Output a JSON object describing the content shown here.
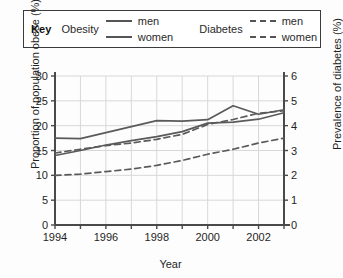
{
  "legend": {
    "title": "Key",
    "groups": [
      {
        "name": "Obesity",
        "entries": [
          {
            "label": "men",
            "style": "solid"
          },
          {
            "label": "women",
            "style": "solid"
          }
        ]
      },
      {
        "name": "Diabetes",
        "entries": [
          {
            "label": "men",
            "style": "dashed"
          },
          {
            "label": "women",
            "style": "dashed"
          }
        ]
      }
    ]
  },
  "axes": {
    "x_title": "Year",
    "y_left_title": "Proportion of population obese (%)",
    "y_right_title": "Prevalence of diabetes (%)",
    "x_ticks": [
      "1994",
      "1996",
      "1998",
      "2000",
      "2002"
    ],
    "y_left_ticks": [
      "0",
      "5",
      "10",
      "15",
      "20",
      "25",
      "30"
    ],
    "y_right_ticks": [
      "0",
      "1",
      "2",
      "3",
      "4",
      "5",
      "6"
    ]
  },
  "colors": {
    "line": "#5a5a5a",
    "axis": "#4a4a4a",
    "grid": "#d8d8d8",
    "background": "#fdfdfd"
  },
  "chart_data": {
    "type": "line",
    "title": "",
    "xlabel": "Year",
    "ylabel": "Proportion of population obese (%)",
    "y2label": "Prevalence of diabetes (%)",
    "xlim": [
      1994,
      2003
    ],
    "ylim": [
      0,
      30
    ],
    "y2lim": [
      0,
      6
    ],
    "grid": true,
    "legend_position": "top",
    "x": [
      1994,
      1995,
      1996,
      1997,
      1998,
      1999,
      2000,
      2001,
      2002,
      2003
    ],
    "series": [
      {
        "name": "Obesity men",
        "axis": "left",
        "style": "solid",
        "units": "%",
        "values": [
          17.5,
          17.4,
          18.6,
          19.8,
          21.0,
          20.9,
          21.2,
          24.0,
          22.3,
          23.2
        ]
      },
      {
        "name": "Obesity women",
        "axis": "left",
        "style": "solid",
        "units": "%",
        "values": [
          14.0,
          15.0,
          16.1,
          17.0,
          17.8,
          18.8,
          20.5,
          20.7,
          21.3,
          22.6
        ]
      },
      {
        "name": "Diabetes men",
        "axis": "right",
        "style": "dashed",
        "units": "%",
        "values": [
          2.9,
          3.05,
          3.2,
          3.3,
          3.45,
          3.65,
          4.05,
          4.25,
          4.5,
          4.6
        ]
      },
      {
        "name": "Diabetes women",
        "axis": "right",
        "style": "dashed",
        "units": "%",
        "values": [
          2.0,
          2.05,
          2.15,
          2.25,
          2.4,
          2.6,
          2.85,
          3.05,
          3.3,
          3.5
        ]
      }
    ]
  }
}
